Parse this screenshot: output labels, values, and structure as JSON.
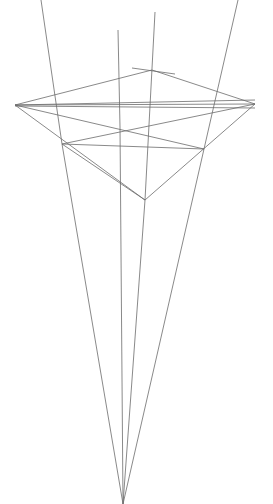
{
  "canvas": {
    "width": 273,
    "height": 504,
    "background_color": "#ffffff",
    "line_color": "#6b6b6b",
    "line_width": 0.8,
    "description": "Line-art wireframe perspective drawing of a bipyramid / octahedron-like solid with long projection rays converging to a single vanishing point near the bottom edge"
  },
  "chart_data": {
    "type": "line",
    "title": "",
    "xlabel": "",
    "ylabel": "",
    "xlim": [
      0,
      273
    ],
    "ylim": [
      0,
      504
    ],
    "grid": false,
    "legend": null,
    "vertices": {
      "left": [
        15,
        105
      ],
      "right": [
        255,
        104
      ],
      "top": [
        152,
        70
      ],
      "bottom": [
        145,
        200
      ],
      "upper_left": [
        63,
        98
      ],
      "upper_right": [
        222,
        96
      ],
      "lower_left": [
        62,
        144
      ],
      "lower_right": [
        204,
        149
      ],
      "center_cross": [
        130,
        127
      ],
      "vanishing_point": [
        123,
        504
      ]
    },
    "segments": [
      {
        "name": "hull-left-to-top",
        "x1": 15,
        "y1": 105,
        "x2": 152,
        "y2": 70
      },
      {
        "name": "hull-top-to-right",
        "x1": 152,
        "y1": 70,
        "x2": 255,
        "y2": 104
      },
      {
        "name": "hull-left-to-bottom",
        "x1": 15,
        "y1": 105,
        "x2": 145,
        "y2": 200
      },
      {
        "name": "hull-bottom-to-right",
        "x1": 145,
        "y1": 200,
        "x2": 255,
        "y2": 104
      },
      {
        "name": "equator-upper",
        "x1": 15,
        "y1": 105,
        "x2": 255,
        "y2": 100
      },
      {
        "name": "equator-middle",
        "x1": 15,
        "y1": 105,
        "x2": 255,
        "y2": 104
      },
      {
        "name": "equator-lower",
        "x1": 15,
        "y1": 106,
        "x2": 255,
        "y2": 108
      },
      {
        "name": "left-to-lower-right",
        "x1": 15,
        "y1": 105,
        "x2": 204,
        "y2": 149
      },
      {
        "name": "right-to-lower-left",
        "x1": 255,
        "y1": 104,
        "x2": 62,
        "y2": 144
      },
      {
        "name": "lower-left-to-lower-right",
        "x1": 62,
        "y1": 144,
        "x2": 204,
        "y2": 149
      },
      {
        "name": "lower-left-to-bottom",
        "x1": 62,
        "y1": 144,
        "x2": 145,
        "y2": 200
      },
      {
        "name": "upper-left-short-tick",
        "x1": 132,
        "y1": 68,
        "x2": 175,
        "y2": 74
      }
    ],
    "rays": [
      {
        "name": "ray-outer-left",
        "x1": 41,
        "y1": 0,
        "x2": 123,
        "y2": 504,
        "passes_through": [
          62,
          144
        ]
      },
      {
        "name": "ray-inner-left",
        "x1": 118,
        "y1": 30,
        "x2": 123,
        "y2": 504,
        "passes_through": [
          120,
          127
        ]
      },
      {
        "name": "ray-inner-right",
        "x1": 155,
        "y1": 12,
        "x2": 123,
        "y2": 504,
        "passes_through": [
          145,
          200
        ]
      },
      {
        "name": "ray-outer-right",
        "x1": 238,
        "y1": 0,
        "x2": 123,
        "y2": 504,
        "passes_through": [
          204,
          149
        ]
      }
    ]
  },
  "labels": {
    "none_visible": ""
  }
}
